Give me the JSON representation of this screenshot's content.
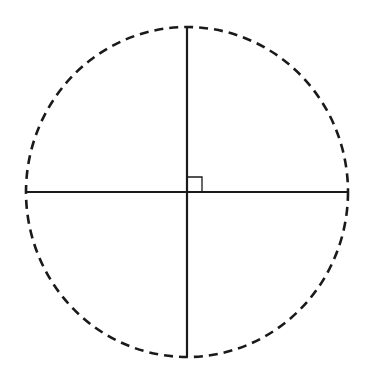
{
  "diagram": {
    "background": "#ffffff",
    "stroke_color": "#1a1a1a",
    "circle": {
      "cx": 187,
      "cy": 192,
      "rx": 161,
      "ry": 165,
      "style": "dashed",
      "stroke_width": 2.6,
      "dasharray": "9 6"
    },
    "vertical_diameter": {
      "x1": 187,
      "y1": 27,
      "x2": 187,
      "y2": 357,
      "stroke_width": 2.2
    },
    "horizontal_diameter": {
      "x1": 26,
      "y1": 192,
      "x2": 348,
      "y2": 192,
      "stroke_width": 2.2
    },
    "right_angle_marker": {
      "x": 187,
      "y": 177,
      "size": 15,
      "stroke_width": 1.3
    }
  }
}
